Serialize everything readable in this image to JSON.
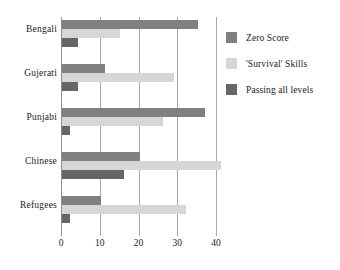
{
  "chart_data": {
    "type": "bar",
    "orientation": "horizontal",
    "title": "",
    "xlabel": "",
    "ylabel": "",
    "categories": [
      "Bengali",
      "Gujerati",
      "Punjabi",
      "Chinese",
      "Refugees"
    ],
    "series": [
      {
        "name": "Zero Score",
        "color": "#808080",
        "values": [
          35,
          11,
          37,
          20,
          10
        ]
      },
      {
        "name": "'Survival' Skills",
        "color": "#d6d6d6",
        "values": [
          15,
          29,
          26,
          41,
          32
        ]
      },
      {
        "name": "Passing all levels",
        "color": "#666666",
        "values": [
          4,
          4,
          2,
          16,
          2
        ]
      }
    ],
    "xlim": [
      0,
      40
    ],
    "xticks": [
      0,
      10,
      20,
      30,
      40
    ],
    "xtick_labels": [
      "0",
      "10",
      "20",
      "30",
      "40"
    ],
    "grid": true,
    "grid_axis": "x",
    "legend_position": "right"
  },
  "legend": {
    "items": [
      {
        "label": "Zero Score"
      },
      {
        "label": "'Survival' Skills"
      },
      {
        "label": "Passing all levels"
      }
    ]
  },
  "axis": {
    "x_tick_labels": [
      "0",
      "10",
      "20",
      "30",
      "40"
    ],
    "y_tick_labels": [
      "Bengali",
      "Gujerati",
      "Punjabi",
      "Chinese",
      "Refugees"
    ]
  },
  "colors": {
    "series_zero_score": "#808080",
    "series_survival_skills": "#d6d6d6",
    "series_passing_all": "#666666",
    "gridline": "#a8a8a8",
    "axis": "#8e8e8e",
    "background": "#ffffff",
    "text": "#222222"
  }
}
